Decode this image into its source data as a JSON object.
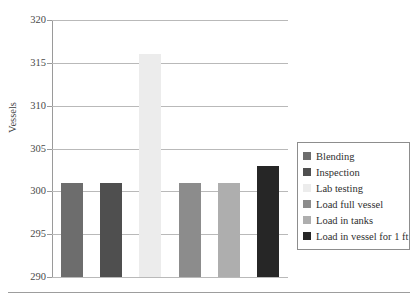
{
  "chart_data": {
    "type": "bar",
    "title": "",
    "subtitle": "",
    "xlabel": "",
    "ylabel": "Vessels",
    "ylim": [
      290,
      320
    ],
    "yticks": [
      290,
      295,
      300,
      305,
      310,
      315,
      320
    ],
    "ytick_labels": [
      "290",
      "295",
      "300",
      "305",
      "310",
      "315",
      "320"
    ],
    "grid": true,
    "xtick_labels": [],
    "legend_position": "right",
    "categories": [
      "Blending",
      "Inspection",
      "Lab testing",
      "Load full vessel",
      "Load in tanks",
      "Load in vessel for 1 ft"
    ],
    "values": [
      301,
      301,
      316,
      301,
      301,
      303
    ],
    "colors": [
      "#6d6d6d",
      "#4f4f4f",
      "#ececec",
      "#8c8c8c",
      "#aeaeae",
      "#262626"
    ],
    "series": [
      {
        "name": "Vessels",
        "values": [
          301,
          301,
          316,
          301,
          301,
          303
        ]
      }
    ]
  },
  "legend": {
    "items": [
      {
        "label": "Blending",
        "color": "#6d6d6d"
      },
      {
        "label": "Inspection",
        "color": "#4f4f4f"
      },
      {
        "label": "Lab testing",
        "color": "#ececec"
      },
      {
        "label": "Load full vessel",
        "color": "#8c8c8c"
      },
      {
        "label": "Load in tanks",
        "color": "#aeaeae"
      },
      {
        "label": "Load in vessel for 1 ft",
        "color": "#262626"
      }
    ]
  },
  "axis": {
    "y_title": "Vessels"
  }
}
